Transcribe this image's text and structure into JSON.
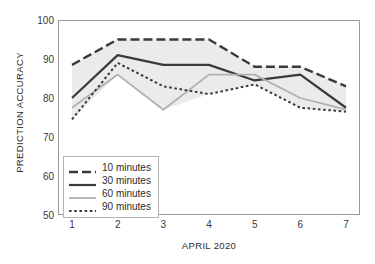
{
  "chart_data": {
    "type": "line",
    "title": "",
    "xlabel": "APRIL 2020",
    "ylabel": "PREDICTION ACCURACY",
    "x": [
      1,
      2,
      3,
      4,
      5,
      6,
      7
    ],
    "xtick_labels": [
      "1",
      "2",
      "3",
      "4",
      "5",
      "6",
      "7"
    ],
    "ytick_labels": [
      "50",
      "60",
      "70",
      "80",
      "90",
      "100"
    ],
    "yticks": [
      50,
      60,
      70,
      80,
      90,
      100
    ],
    "ylim": [
      50,
      100
    ],
    "xlim": [
      1,
      7
    ],
    "grid": false,
    "legend_position": "lower-left-inside",
    "band": {
      "description": "shaded region between 10-minute upper envelope and lower envelope",
      "color": "#ebebeb",
      "upper": [
        88.5,
        95.0,
        95.0,
        95.0,
        88.0,
        88.0,
        83.0
      ],
      "lower": [
        74.5,
        86.0,
        77.0,
        81.0,
        83.5,
        77.5,
        76.5
      ]
    },
    "series": [
      {
        "name": "10 minutes",
        "values": [
          88.5,
          95.0,
          95.0,
          95.0,
          88.0,
          88.0,
          83.0
        ],
        "color": "#3a3a3a",
        "style": "long-dash",
        "width": 2.4
      },
      {
        "name": "30 minutes",
        "values": [
          80.0,
          91.0,
          88.5,
          88.5,
          84.5,
          86.0,
          77.5
        ],
        "color": "#3a3a3a",
        "style": "solid",
        "width": 2.2
      },
      {
        "name": "60 minutes",
        "values": [
          77.5,
          86.0,
          77.0,
          86.0,
          86.0,
          80.0,
          77.0
        ],
        "color": "#b0b0b0",
        "style": "solid",
        "width": 1.8
      },
      {
        "name": "90 minutes",
        "values": [
          74.5,
          89.0,
          83.0,
          81.0,
          83.5,
          77.5,
          76.5
        ],
        "color": "#3a3a3a",
        "style": "dotted",
        "width": 2.0
      }
    ]
  },
  "legend": {
    "items": [
      {
        "label": "10 minutes"
      },
      {
        "label": "30 minutes"
      },
      {
        "label": "60 minutes"
      },
      {
        "label": "90 minutes"
      }
    ]
  }
}
